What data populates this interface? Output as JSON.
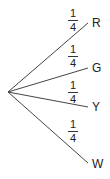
{
  "tree": {
    "branches": [
      {
        "outcome": "R",
        "probability": {
          "numerator": "1",
          "denominator": "4"
        }
      },
      {
        "outcome": "G",
        "probability": {
          "numerator": "1",
          "denominator": "4"
        }
      },
      {
        "outcome": "Y",
        "probability": {
          "numerator": "1",
          "denominator": "4"
        }
      },
      {
        "outcome": "W",
        "probability": {
          "numerator": "1",
          "denominator": "4"
        }
      }
    ]
  },
  "colors": {
    "line": "#444444",
    "text": "#222222"
  }
}
